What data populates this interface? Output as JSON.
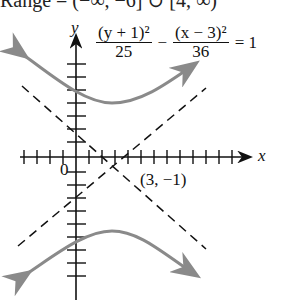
{
  "figure": {
    "top_cut_text": "Range = (−∞, −6] ∪ [4, ∞)",
    "equation": {
      "term1_num": "(y + 1)²",
      "term1_den": "25",
      "minus": "−",
      "term2_num": "(x − 3)²",
      "term2_den": "36",
      "rhs": "= 1"
    },
    "axes": {
      "x_label": "x",
      "y_label": "y",
      "origin_label": "0"
    },
    "center_label": "(3, −1)",
    "colors": {
      "curve": "#8a8a8a",
      "axes": "#111111",
      "asymptote": "#111111"
    }
  }
}
